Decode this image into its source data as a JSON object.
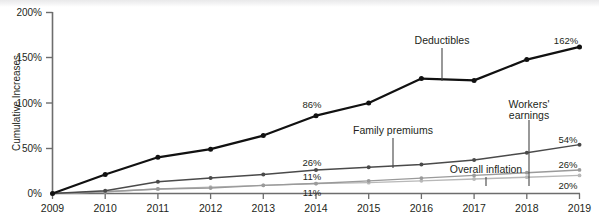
{
  "chart_data": {
    "type": "line",
    "title": "",
    "subtitle": "",
    "xlabel": "",
    "ylabel": "Cumulative Increases",
    "x": [
      2009,
      2010,
      2011,
      2012,
      2013,
      2014,
      2015,
      2016,
      2017,
      2018,
      2019
    ],
    "xtick_labels": [
      "2009",
      "2010",
      "2011",
      "2012",
      "2013",
      "2014",
      "2015",
      "2016",
      "2017",
      "2018",
      "2019"
    ],
    "ytick_labels": [
      "0%",
      "50%",
      "100%",
      "150%",
      "200%"
    ],
    "ytick_values": [
      0,
      50,
      100,
      150,
      200
    ],
    "ylim": [
      0,
      200
    ],
    "xlim": [
      2009,
      2019
    ],
    "grid": false,
    "legend": "inline-annotations",
    "units": "percent",
    "series": [
      {
        "name": "Deductibles",
        "color": "#111111",
        "values": [
          0,
          21,
          40,
          49,
          64,
          86,
          100,
          127,
          125,
          148,
          162
        ],
        "end_label": "162%",
        "mid_label": "86%",
        "mid_label_year": 2014
      },
      {
        "name": "Family premiums",
        "color": "#4a4a4a",
        "values": [
          0,
          3,
          13,
          17,
          21,
          26,
          29,
          32,
          37,
          45,
          54
        ],
        "end_label": "54%",
        "mid_label": "26%",
        "mid_label_year": 2014
      },
      {
        "name": "Workers' earnings",
        "color": "#9a9a9a",
        "values": [
          0,
          2,
          5,
          6,
          9,
          11,
          14,
          17,
          20,
          23,
          26
        ],
        "end_label": "26%",
        "mid_label": "11%",
        "mid_label_year": 2014
      },
      {
        "name": "Overall inflation",
        "color": "#b8b8b8",
        "values": [
          0,
          2,
          5,
          7,
          9,
          11,
          12,
          14,
          16,
          18,
          20
        ],
        "end_label": "20%",
        "mid_label": "11%",
        "mid_label_year": 2014
      }
    ],
    "annotations": [
      {
        "text": "Deductibles",
        "target_series": "Deductibles"
      },
      {
        "text": "Family premiums",
        "target_series": "Family premiums"
      },
      {
        "text": "Workers'",
        "target_series": "Workers' earnings"
      },
      {
        "text": "earnings",
        "target_series": "Workers' earnings"
      },
      {
        "text": "Overall inflation",
        "target_series": "Overall inflation"
      }
    ]
  },
  "axis": {
    "y_title": "Cumulative Increases",
    "y_ticks": [
      "200%",
      "150%",
      "100%",
      "50%",
      "0%"
    ],
    "x_ticks": [
      "2009",
      "2010",
      "2011",
      "2012",
      "2013",
      "2014",
      "2015",
      "2016",
      "2017",
      "2018",
      "2019"
    ]
  },
  "labels": {
    "deductibles": "Deductibles",
    "family_premiums": "Family premiums",
    "workers_line1": "Workers'",
    "workers_line2": "earnings",
    "overall_inflation": "Overall inflation",
    "val_162": "162%",
    "val_86": "86%",
    "val_54": "54%",
    "val_26_end": "26%",
    "val_26_mid": "26%",
    "val_20": "20%",
    "val_11_upper": "11%",
    "val_11_lower": "11%"
  }
}
